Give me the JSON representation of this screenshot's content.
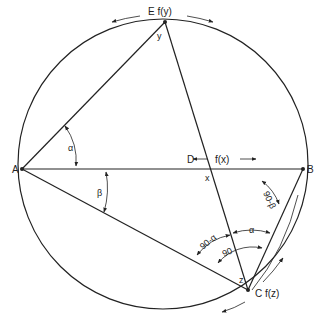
{
  "diagram": {
    "type": "geometry-circle-inscribed-triangles",
    "points": {
      "A": {
        "label": "A"
      },
      "B": {
        "label": "B"
      },
      "D": {
        "label": "D"
      },
      "E": {
        "label": "E f(y)"
      },
      "C": {
        "label": "C f(z)"
      }
    },
    "point_labels": {
      "x": "x",
      "y": "y",
      "z": "z"
    },
    "function_labels": {
      "fx": "f(x)"
    },
    "angle_labels": {
      "alpha_A": "α",
      "beta_A": "β",
      "ninety_minus_beta": "90-β",
      "alpha_C": "α",
      "ninety_minus_alpha": "90-α",
      "ninety": "90"
    }
  }
}
